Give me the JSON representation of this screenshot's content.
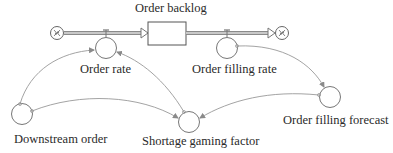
{
  "diagram": {
    "type": "stock-and-flow",
    "colors": {
      "stroke": "#7a7a7a",
      "pipe": "#8a8a8a",
      "text": "#2a2a2a",
      "background": "#ffffff"
    },
    "stock": {
      "label": "Order backlog"
    },
    "flows": [
      {
        "id": "order_rate",
        "label": "Order rate",
        "from": "source-cloud",
        "to": "Order backlog"
      },
      {
        "id": "order_filling_rate",
        "label": "Order filling rate",
        "from": "Order backlog",
        "to": "sink-cloud"
      }
    ],
    "auxiliaries": [
      {
        "id": "downstream_order",
        "label": "Downstream order"
      },
      {
        "id": "shortage_gaming_factor",
        "label": "Shortage gaming factor"
      },
      {
        "id": "order_filling_forecast",
        "label": "Order filling forecast"
      }
    ],
    "links": [
      {
        "from": "Downstream order",
        "to": "Order rate"
      },
      {
        "from": "Downstream order",
        "to": "Shortage gaming factor"
      },
      {
        "from": "Shortage gaming factor",
        "to": "Order rate"
      },
      {
        "from": "Order filling rate",
        "to": "Order filling forecast"
      },
      {
        "from": "Order filling forecast",
        "to": "Shortage gaming factor"
      }
    ]
  }
}
